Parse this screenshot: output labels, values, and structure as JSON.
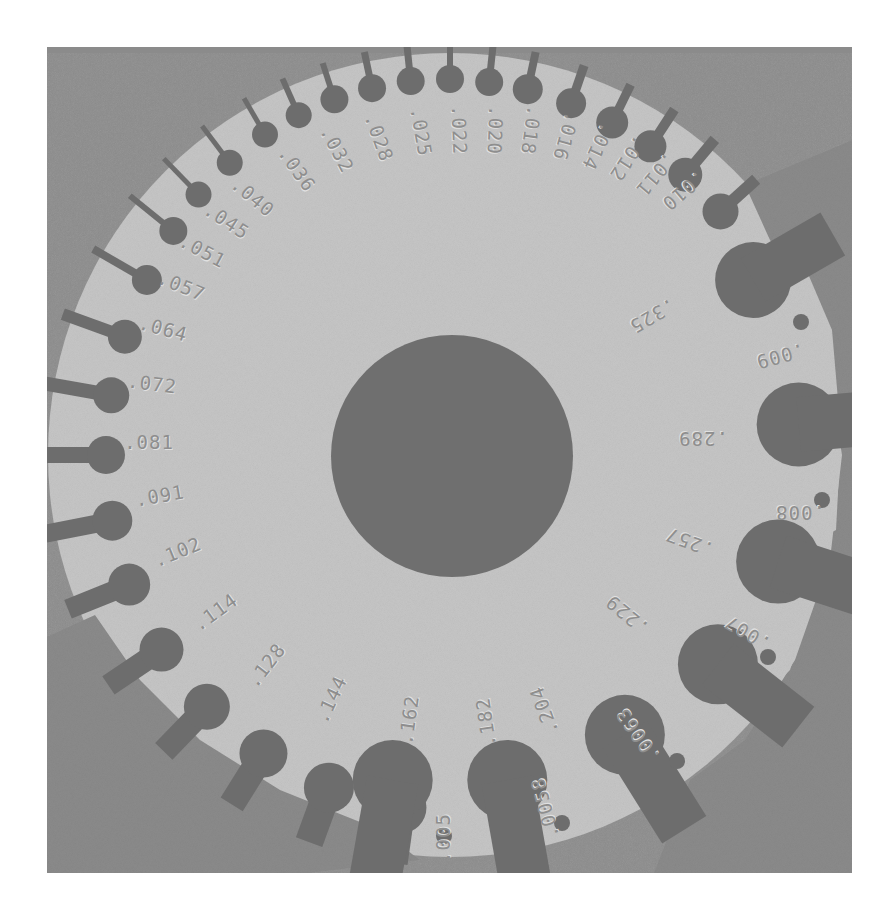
{
  "image": {
    "subject": "Round wire gauge disc (grayscale photograph)",
    "colors": {
      "background": "#8b8b8b",
      "disc": "#c6c6c6",
      "hole": "#6d6d6d",
      "engraving": "#8e8e8e"
    },
    "center_hole": {
      "cx": 452,
      "cy": 456,
      "r": 121
    }
  },
  "outer_gauge_labels": [
    {
      "text": ".040",
      "x": 252,
      "y": 198,
      "rot": 40
    },
    {
      "text": ".036",
      "x": 296,
      "y": 170,
      "rot": 55
    },
    {
      "text": ".032",
      "x": 336,
      "y": 150,
      "rot": 62
    },
    {
      "text": ".028",
      "x": 378,
      "y": 138,
      "rot": 70
    },
    {
      "text": ".025",
      "x": 420,
      "y": 132,
      "rot": 80
    },
    {
      "text": ".022",
      "x": 458,
      "y": 130,
      "rot": 88
    },
    {
      "text": ".020",
      "x": 494,
      "y": 130,
      "rot": 92
    },
    {
      "text": ".018",
      "x": 530,
      "y": 130,
      "rot": 98
    },
    {
      "text": ".016",
      "x": 565,
      "y": 136,
      "rot": 106
    },
    {
      "text": ".014",
      "x": 597,
      "y": 146,
      "rot": 115
    },
    {
      "text": ".012",
      "x": 627,
      "y": 158,
      "rot": 123
    },
    {
      "text": ".011",
      "x": 655,
      "y": 174,
      "rot": 130
    },
    {
      "text": ".010",
      "x": 683,
      "y": 190,
      "rot": 140
    },
    {
      "text": ".045",
      "x": 226,
      "y": 222,
      "rot": 33
    },
    {
      "text": ".051",
      "x": 202,
      "y": 252,
      "rot": 28
    },
    {
      "text": ".057",
      "x": 181,
      "y": 287,
      "rot": 22
    },
    {
      "text": ".064",
      "x": 163,
      "y": 330,
      "rot": 15
    },
    {
      "text": ".072",
      "x": 152,
      "y": 385,
      "rot": 7
    },
    {
      "text": ".081",
      "x": 149,
      "y": 443,
      "rot": 0
    },
    {
      "text": ".091",
      "x": 160,
      "y": 497,
      "rot": -10
    },
    {
      "text": ".102",
      "x": 178,
      "y": 553,
      "rot": -22
    },
    {
      "text": ".114",
      "x": 216,
      "y": 613,
      "rot": -36
    },
    {
      "text": ".128",
      "x": 267,
      "y": 666,
      "rot": -52
    },
    {
      "text": ".144",
      "x": 332,
      "y": 700,
      "rot": -65
    },
    {
      "text": ".162",
      "x": 410,
      "y": 720,
      "rot": -82
    },
    {
      "text": ".182",
      "x": 487,
      "y": 722,
      "rot": -98
    }
  ],
  "inner_gauge_labels": [
    {
      "text": ".204",
      "x": 545,
      "y": 710,
      "rot": -110
    },
    {
      "text": ".229",
      "x": 628,
      "y": 614,
      "rot": -140
    },
    {
      "text": ".257",
      "x": 690,
      "y": 541,
      "rot": -160
    },
    {
      "text": ".289",
      "x": 703,
      "y": 437,
      "rot": 180
    },
    {
      "text": ".325",
      "x": 652,
      "y": 315,
      "rot": 150
    }
  ],
  "sheet_gauge_labels": [
    {
      "text": ".009",
      "x": 780,
      "y": 355,
      "rot": 165
    },
    {
      "text": ".008",
      "x": 800,
      "y": 511,
      "rot": 180
    },
    {
      "text": ".007",
      "x": 748,
      "y": 632,
      "rot": -150
    },
    {
      "text": ".0063",
      "x": 639,
      "y": 735,
      "rot": -125
    },
    {
      "text": ".0058",
      "x": 546,
      "y": 808,
      "rot": -105
    },
    {
      "text": ".005",
      "x": 444,
      "y": 838,
      "rot": -90
    }
  ]
}
